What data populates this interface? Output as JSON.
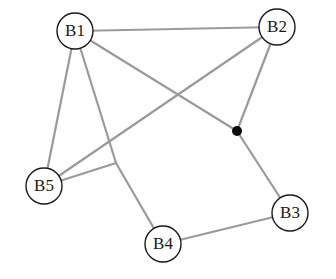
{
  "diagram": {
    "type": "network-graph",
    "node_radius": 18,
    "colors": {
      "edge": "#9a9a9a",
      "node_stroke": "#1a1a1a",
      "node_fill": "#ffffff",
      "junction": "#0a0a0a"
    },
    "nodes": [
      {
        "id": "B1",
        "label": "B1",
        "x": 75,
        "y": 31
      },
      {
        "id": "B2",
        "label": "B2",
        "x": 277,
        "y": 27
      },
      {
        "id": "B3",
        "label": "B3",
        "x": 290,
        "y": 213
      },
      {
        "id": "B4",
        "label": "B4",
        "x": 163,
        "y": 244
      },
      {
        "id": "B5",
        "label": "B5",
        "x": 44,
        "y": 186
      }
    ],
    "junctions": [
      {
        "id": "J1",
        "x": 237,
        "y": 131,
        "filled": true
      }
    ],
    "edges": [
      {
        "from": "B1",
        "to": "B2",
        "points": [
          [
            75,
            31
          ],
          [
            277,
            27
          ]
        ]
      },
      {
        "from": "B1",
        "to": "B5",
        "points": [
          [
            75,
            31
          ],
          [
            44,
            186
          ]
        ]
      },
      {
        "from": "B1",
        "to": "J1",
        "points": [
          [
            75,
            31
          ],
          [
            237,
            131
          ]
        ]
      },
      {
        "from": "J1",
        "to": "B3",
        "points": [
          [
            237,
            131
          ],
          [
            290,
            213
          ]
        ]
      },
      {
        "from": "B2",
        "to": "J1",
        "points": [
          [
            277,
            27
          ],
          [
            237,
            131
          ]
        ]
      },
      {
        "from": "B2",
        "to": "B5",
        "points": [
          [
            277,
            27
          ],
          [
            44,
            186
          ]
        ]
      },
      {
        "from": "B1",
        "to": "B4",
        "points": [
          [
            75,
            31
          ],
          [
            116,
            163
          ],
          [
            163,
            244
          ]
        ]
      },
      {
        "from": "B5",
        "to": "bend",
        "points": [
          [
            44,
            186
          ],
          [
            116,
            163
          ]
        ]
      },
      {
        "from": "B4",
        "to": "B3",
        "points": [
          [
            163,
            244
          ],
          [
            290,
            213
          ]
        ]
      }
    ]
  }
}
